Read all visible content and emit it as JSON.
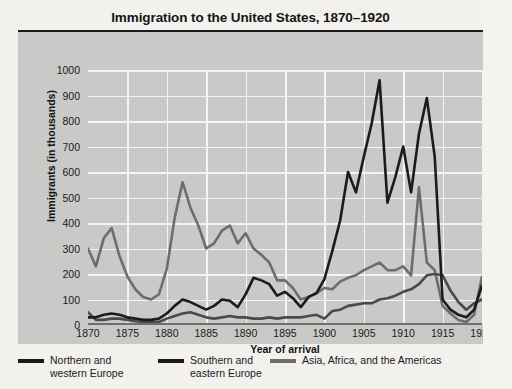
{
  "chart_data": {
    "type": "line",
    "title": "Immigration to the United States, 1870–1920",
    "xlabel": "Year of arrival",
    "ylabel": "Immigrants (in thousands)",
    "xlim": [
      1870,
      1920
    ],
    "ylim": [
      0,
      1000
    ],
    "yticks": [
      0,
      100,
      200,
      300,
      400,
      500,
      600,
      700,
      800,
      900,
      1000
    ],
    "xticks": [
      1870,
      1875,
      1880,
      1885,
      1890,
      1895,
      1900,
      1905,
      1910,
      1915,
      1920
    ],
    "grid": true,
    "legend_position": "below",
    "x": [
      1870,
      1871,
      1872,
      1873,
      1874,
      1875,
      1876,
      1877,
      1878,
      1879,
      1880,
      1881,
      1882,
      1883,
      1884,
      1885,
      1886,
      1887,
      1888,
      1889,
      1890,
      1891,
      1892,
      1893,
      1894,
      1895,
      1896,
      1897,
      1898,
      1899,
      1900,
      1901,
      1902,
      1903,
      1904,
      1905,
      1906,
      1907,
      1908,
      1909,
      1910,
      1911,
      1912,
      1913,
      1914,
      1915,
      1916,
      1917,
      1918,
      1919,
      1920
    ],
    "series": [
      {
        "name": "Northern and western Europe",
        "color": "#6d6d6b",
        "values": [
          300,
          230,
          340,
          380,
          270,
          190,
          140,
          110,
          100,
          120,
          220,
          420,
          560,
          460,
          390,
          300,
          320,
          370,
          390,
          320,
          360,
          300,
          275,
          245,
          175,
          175,
          145,
          100,
          110,
          125,
          145,
          140,
          170,
          185,
          195,
          215,
          230,
          245,
          215,
          215,
          230,
          195,
          540,
          245,
          215,
          75,
          45,
          20,
          12,
          40,
          190
        ]
      },
      {
        "name": "Southern and eastern Europe",
        "color": "#1b1b1b",
        "values": [
          30,
          30,
          40,
          45,
          40,
          30,
          25,
          20,
          20,
          25,
          45,
          75,
          100,
          90,
          75,
          60,
          75,
          100,
          95,
          70,
          120,
          185,
          175,
          160,
          115,
          130,
          105,
          70,
          110,
          125,
          180,
          290,
          410,
          600,
          520,
          660,
          790,
          960,
          480,
          580,
          700,
          520,
          750,
          890,
          660,
          100,
          60,
          40,
          30,
          60,
          155
        ]
      },
      {
        "name": "Asia, Africa, and the Americas",
        "color": "#4a4a48",
        "values": [
          50,
          20,
          20,
          25,
          25,
          20,
          15,
          12,
          12,
          12,
          25,
          35,
          45,
          50,
          40,
          30,
          25,
          30,
          35,
          30,
          30,
          25,
          25,
          30,
          25,
          30,
          30,
          30,
          35,
          40,
          25,
          55,
          60,
          75,
          80,
          85,
          85,
          100,
          105,
          115,
          130,
          140,
          160,
          195,
          200,
          195,
          135,
          90,
          60,
          85,
          100
        ]
      }
    ]
  },
  "legend": {
    "items": [
      {
        "label": "Northern and\nwestern Europe",
        "swatch_color": "#1b1b1b"
      },
      {
        "label": "Southern and\neastern Europe",
        "swatch_color": "#1b1b1b"
      },
      {
        "label": "Asia, Africa, and the Americas",
        "swatch_color": "#6d6d6b"
      }
    ]
  }
}
